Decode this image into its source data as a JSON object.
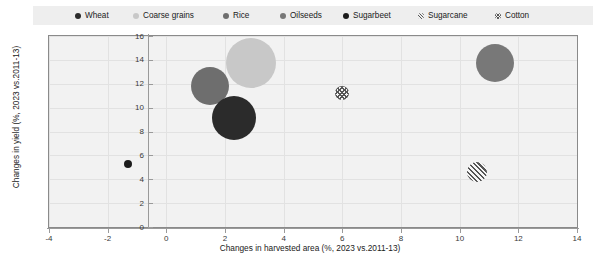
{
  "legend": {
    "items": [
      {
        "label": "Wheat",
        "marker": "filled-circle-dark",
        "color": "#2b2b2b",
        "x": 42
      },
      {
        "label": "Coarse grains",
        "marker": "filled-circle-light",
        "color": "#c8c8c8",
        "x": 100
      },
      {
        "label": "Rice",
        "marker": "filled-circle-medium",
        "color": "#6e6e6e",
        "x": 190
      },
      {
        "label": "Oilseeds",
        "marker": "filled-circle-medium",
        "color": "#787878",
        "x": 247
      },
      {
        "label": "Sugarbeet",
        "marker": "filled-circle-dark",
        "color": "#1c1c1c",
        "x": 310
      },
      {
        "label": "Sugarcane",
        "marker": "hatched-diagonal",
        "color": "#555555",
        "x": 385
      },
      {
        "label": "Cotton",
        "marker": "hatched-cross",
        "color": "#555555",
        "x": 462
      }
    ]
  },
  "chart_data": {
    "type": "scatter",
    "title": "",
    "xlabel": "Changes in harvested area (%, 2023 vs.2011-13)",
    "ylabel": "Changes in yield (%, 2023 vs.2011-13)",
    "xlim": [
      -4,
      14
    ],
    "ylim": [
      0,
      16
    ],
    "xticks": [
      -4,
      -2,
      0,
      2,
      4,
      6,
      8,
      10,
      12,
      14
    ],
    "yticks": [
      0,
      2,
      4,
      6,
      8,
      10,
      12,
      14,
      16
    ],
    "grid": true,
    "legend_position": "top",
    "bubble_size_note": "marker area proportional to commodity volume",
    "points": [
      {
        "name": "Rice",
        "x": 1.5,
        "y": 11.8,
        "r": 19,
        "color": "#6e6e6e",
        "marker": "circle"
      },
      {
        "name": "Coarse grains",
        "x": 2.9,
        "y": 13.7,
        "r": 25,
        "color": "#c8c8c8",
        "marker": "circle"
      },
      {
        "name": "Wheat",
        "x": 2.3,
        "y": 9.1,
        "r": 22,
        "color": "#2b2b2b",
        "marker": "circle"
      },
      {
        "name": "Cotton",
        "x": 6.0,
        "y": 11.2,
        "r": 7,
        "color": "#555555",
        "marker": "hatched-cross"
      },
      {
        "name": "Oilseeds",
        "x": 11.2,
        "y": 13.7,
        "r": 19,
        "color": "#787878",
        "marker": "circle"
      },
      {
        "name": "Sugarcane",
        "x": 10.6,
        "y": 4.6,
        "r": 10,
        "color": "#555555",
        "marker": "hatched-diagonal"
      },
      {
        "name": "Sugarbeet",
        "x": -1.3,
        "y": 5.3,
        "r": 4,
        "color": "#1c1c1c",
        "marker": "circle"
      }
    ]
  }
}
